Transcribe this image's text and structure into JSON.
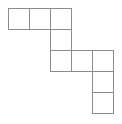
{
  "figure": {
    "name": "polyomino-staircase-figure",
    "background_color": "#ffffff",
    "line_color": "#8c8c8c",
    "line_width": 1,
    "grid": {
      "origin_x": 8,
      "origin_y": 8,
      "cell_size": 21,
      "columns": 5,
      "rows": 5
    },
    "cells": [
      {
        "label": "cell-r0c0",
        "col": 0,
        "row": 0
      },
      {
        "label": "cell-r0c1",
        "col": 1,
        "row": 0
      },
      {
        "label": "cell-r0c2",
        "col": 2,
        "row": 0
      },
      {
        "label": "cell-r1c2",
        "col": 2,
        "row": 1
      },
      {
        "label": "cell-r2c2",
        "col": 2,
        "row": 2
      },
      {
        "label": "cell-r2c3",
        "col": 3,
        "row": 2
      },
      {
        "label": "cell-r2c4",
        "col": 4,
        "row": 2
      },
      {
        "label": "cell-r3c4",
        "col": 4,
        "row": 3
      },
      {
        "label": "cell-r4c4",
        "col": 4,
        "row": 4
      }
    ],
    "cell_count": 9
  }
}
